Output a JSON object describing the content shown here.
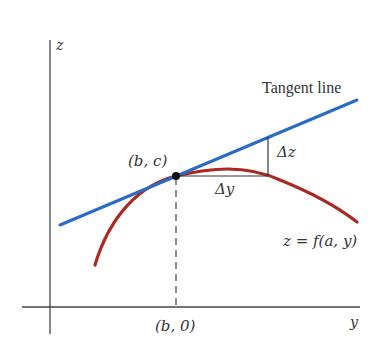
{
  "diagram": {
    "axes": {
      "vertical_label": "z",
      "horizontal_label": "y"
    },
    "labels": {
      "tangent_line": "Tangent line",
      "point": "(b, c)",
      "point_projection": "(b, 0)",
      "delta_z": "Δz",
      "delta_y": "Δy",
      "curve": "z = f(a, y)"
    },
    "colors": {
      "tangent_line": "#2a6bc4",
      "curve": "#a82a22",
      "axes": "#444444",
      "point": "#111111",
      "text": "#333333"
    }
  }
}
